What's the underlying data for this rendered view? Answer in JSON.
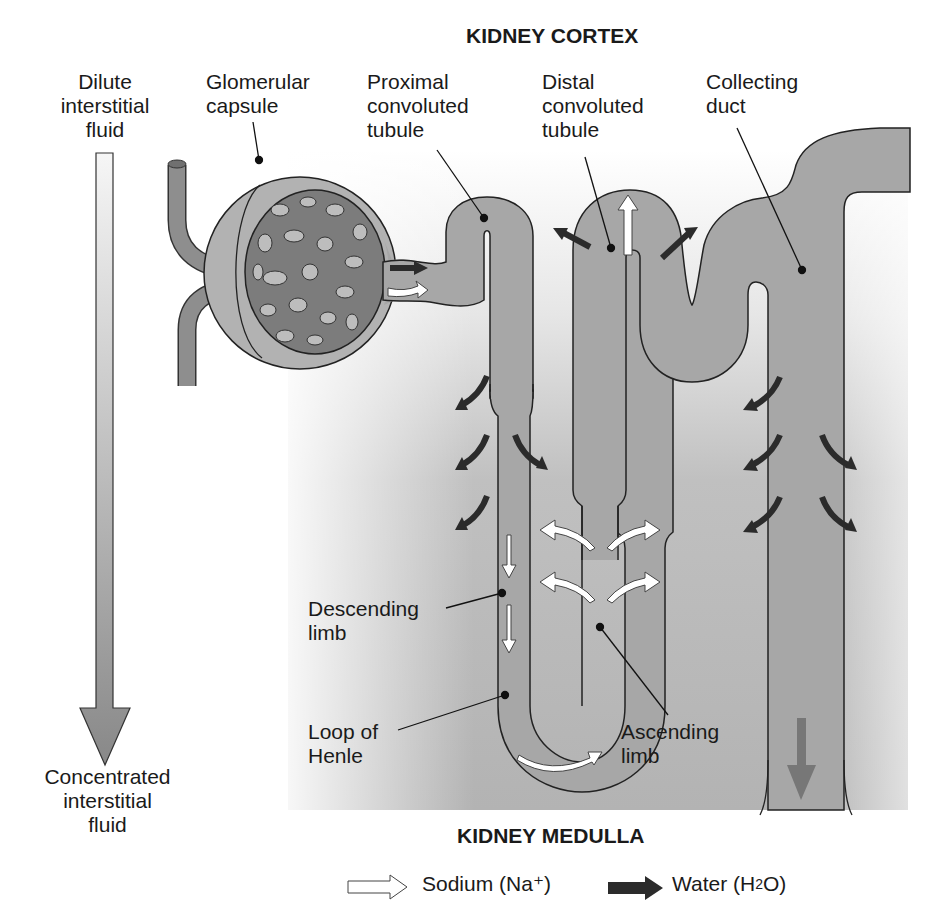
{
  "title_top": "KIDNEY CORTEX",
  "title_bottom": "KIDNEY MEDULLA",
  "gradient_arrow": {
    "top_label": [
      "Dilute",
      "interstitial",
      "fluid"
    ],
    "bottom_label": [
      "Concentrated",
      "interstitial",
      "fluid"
    ]
  },
  "labels": {
    "glomerular_capsule": [
      "Glomerular",
      "capsule"
    ],
    "proximal_tubule": [
      "Proximal",
      "convoluted",
      "tubule"
    ],
    "distal_tubule": [
      "Distal",
      "convoluted",
      "tubule"
    ],
    "collecting_duct": [
      "Collecting",
      "duct"
    ],
    "descending_limb": [
      "Descending",
      "limb"
    ],
    "loop_of_henle": [
      "Loop of",
      "Henle"
    ],
    "ascending_limb": [
      "Ascending",
      "limb"
    ]
  },
  "legend": {
    "sodium": "Sodium (Na⁺)",
    "water_prefix": "Water (H",
    "water_sub": "2",
    "water_suffix": "O)"
  },
  "colors": {
    "medulla_bg": "#b4b4b4",
    "tubule_fill": "#a6a6a6",
    "water_arrow": "#2b2b2b",
    "sodium_arrow": "#ffffff"
  }
}
